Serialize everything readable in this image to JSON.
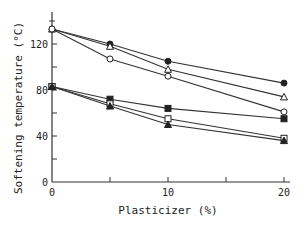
{
  "chart_data": {
    "type": "line",
    "title": "",
    "xlabel": "Plasticizer (%)",
    "ylabel": "Softening temperature (°C)",
    "xlim": [
      0,
      20
    ],
    "ylim": [
      0,
      140
    ],
    "x_ticks": [
      "0",
      "10",
      "20"
    ],
    "y_ticks": [
      "0",
      "40",
      "80",
      "120"
    ],
    "grid": false,
    "legend": "none (series distinguished by marker shape)",
    "x": [
      0,
      5,
      10,
      20
    ],
    "series": [
      {
        "name": "filled-circle",
        "marker": "filled-circle",
        "values": [
          133,
          120,
          105,
          86
        ]
      },
      {
        "name": "open-triangle",
        "marker": "open-triangle",
        "values": [
          133,
          118,
          98,
          74
        ]
      },
      {
        "name": "open-circle",
        "marker": "open-circle",
        "values": [
          133,
          107,
          92,
          61
        ]
      },
      {
        "name": "filled-square",
        "marker": "filled-square",
        "values": [
          83,
          72,
          64,
          55
        ]
      },
      {
        "name": "open-square",
        "marker": "open-square",
        "values": [
          83,
          68,
          55,
          38
        ]
      },
      {
        "name": "filled-triangle",
        "marker": "filled-triangle",
        "values": [
          83,
          66,
          50,
          36
        ]
      }
    ]
  },
  "axis": {
    "xlabel": "Plasticizer (%)",
    "ylabel": "Softening temperature (°C)",
    "x_ticks": [
      "0",
      "10",
      "20"
    ],
    "y_ticks": [
      "0",
      "40",
      "80",
      "120"
    ]
  }
}
